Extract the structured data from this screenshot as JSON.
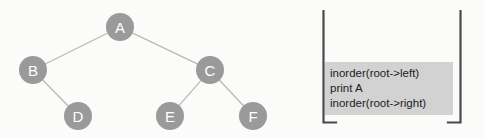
{
  "figure": {
    "background_color": "#fbfbfa"
  },
  "tree": {
    "name": "binary-tree",
    "node_fill": "#9a9a9a",
    "node_label_color": "#ffffff",
    "edge_color": "#b9b9b9",
    "node_radius": 14,
    "nodes": [
      {
        "id": "A",
        "label": "A",
        "cx": 120,
        "cy": 27
      },
      {
        "id": "B",
        "label": "B",
        "cx": 33,
        "cy": 70
      },
      {
        "id": "C",
        "label": "C",
        "cx": 210,
        "cy": 70
      },
      {
        "id": "D",
        "label": "D",
        "cx": 78,
        "cy": 116
      },
      {
        "id": "E",
        "label": "E",
        "cx": 170,
        "cy": 116
      },
      {
        "id": "F",
        "label": "F",
        "cx": 253,
        "cy": 116
      }
    ],
    "edges": [
      {
        "from": "A",
        "to": "B"
      },
      {
        "from": "A",
        "to": "C"
      },
      {
        "from": "B",
        "to": "D"
      },
      {
        "from": "C",
        "to": "E"
      },
      {
        "from": "C",
        "to": "F"
      }
    ]
  },
  "code": {
    "name": "inorder-traversal-pseudocode",
    "block_background": "#d2d2d2",
    "text_color": "#1c1c1c",
    "bracket_color": "#4a4a4a",
    "lines": [
      "inorder(root->left)",
      "print A",
      "inorder(root->right)"
    ]
  }
}
